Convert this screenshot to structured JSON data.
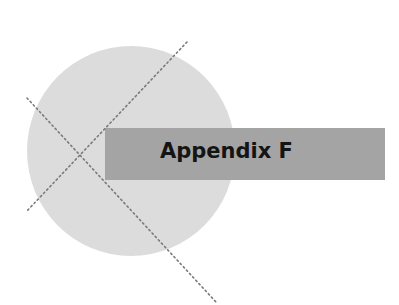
{
  "page": {
    "title": "Appendix F"
  },
  "colors": {
    "background": "#ffffff",
    "circle": "#dcdcdc",
    "band": "#a4a4a4",
    "text": "#141414",
    "dotted_lines": "#7a7a7a"
  }
}
